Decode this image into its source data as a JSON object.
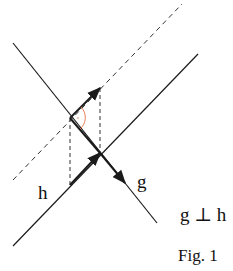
{
  "labels": {
    "h": "h",
    "g": "g",
    "relation": "g ⊥ h",
    "caption": "Fig. 1"
  },
  "colors": {
    "line": "#1a1a1a",
    "angle_arc": "#e8805a",
    "background": "#ffffff"
  },
  "geometry": {
    "line_g": {
      "x1": 13,
      "y1": 43,
      "x2": 157,
      "y2": 223,
      "style": "solid"
    },
    "line_h": {
      "x1": 13,
      "y1": 246,
      "x2": 198,
      "y2": 54,
      "style": "solid"
    },
    "line_h_parallel": {
      "x1": 13,
      "y1": 180,
      "x2": 182,
      "y2": 4,
      "style": "dashed"
    },
    "intersection": {
      "x": 100,
      "y": 153
    },
    "vector_on_h": {
      "x1": 70,
      "y1": 185,
      "x2": 100,
      "y2": 153
    },
    "vector_on_parallel": {
      "x1": 70,
      "y1": 118,
      "x2": 100,
      "y2": 88
    },
    "vector_on_g": {
      "x1": 100,
      "y1": 153,
      "x2": 125,
      "y2": 183
    },
    "projection_left": {
      "x1": 70,
      "y1": 118,
      "x2": 70,
      "y2": 185
    },
    "projection_right": {
      "x1": 100,
      "y1": 88,
      "x2": 100,
      "y2": 153
    },
    "right_angle_marker": {
      "cx": 70,
      "cy": 118
    }
  }
}
